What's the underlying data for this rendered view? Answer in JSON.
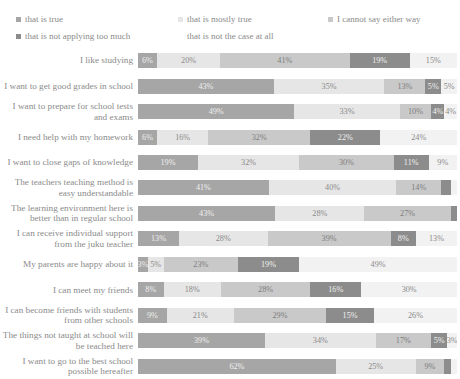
{
  "legend": {
    "rows": [
      [
        {
          "label": "that is true",
          "color": "#a6a6a6",
          "swatch": true
        },
        {
          "label": "that is mostly true",
          "color": "#e6e6e6",
          "swatch": true
        },
        {
          "label": "I cannot say either way",
          "color": "#c9c9c9",
          "swatch": true
        }
      ],
      [
        {
          "label": "that is not applying too much",
          "color": "#8c8c8c",
          "swatch": true
        },
        {
          "label": "that is not the case at all",
          "color": "#f2f2f2",
          "swatch": false
        }
      ]
    ]
  },
  "chart_data": {
    "type": "bar",
    "orientation": "horizontal",
    "stacked": true,
    "stack_total": 100,
    "title": "",
    "xlabel": "",
    "ylabel": "",
    "xlim": [
      0,
      100
    ],
    "grid": false,
    "legend_position": "top",
    "series": [
      {
        "name": "that is true",
        "color": "#a6a6a6",
        "values": [
          6,
          43,
          49,
          6,
          19,
          41,
          43,
          13,
          3,
          8,
          9,
          39,
          62
        ]
      },
      {
        "name": "that is mostly true",
        "color": "#e6e6e6",
        "values": [
          20,
          35,
          33,
          16,
          32,
          40,
          28,
          28,
          5,
          18,
          21,
          34,
          25
        ]
      },
      {
        "name": "I cannot say either way",
        "color": "#c9c9c9",
        "values": [
          41,
          13,
          10,
          32,
          30,
          14,
          27,
          39,
          23,
          28,
          29,
          17,
          9
        ]
      },
      {
        "name": "that is not applying too much",
        "color": "#8c8c8c",
        "values": [
          19,
          5,
          4,
          22,
          11,
          3,
          2,
          8,
          19,
          16,
          15,
          5,
          2
        ]
      },
      {
        "name": "that is not the case at all",
        "color": "#f2f2f2",
        "values": [
          15,
          5,
          4,
          24,
          9,
          2,
          0,
          13,
          49,
          30,
          26,
          3,
          2
        ]
      }
    ],
    "categories": [
      "I like studying",
      "I want to get good grades in school",
      "I want to prepare for school tests and exams",
      "I need help with my homework",
      "I want to close gaps of knowledge",
      "The teachers teaching method is easy understandable",
      "The learning environment here is better than in regular school",
      "I can receive individual support from the juku teacher",
      "My parents are happy about it",
      "I can meet my friends",
      "I can become friends with students from other schools",
      "The things not taught at school will be teached here",
      "I want to go to the best school possible hereafter"
    ],
    "data_labels": [
      [
        "6%",
        "20%",
        "41%",
        "19%",
        "15%"
      ],
      [
        "43%",
        "35%",
        "13%",
        "5%",
        "5%"
      ],
      [
        "49%",
        "33%",
        "10%",
        "4%",
        "4%"
      ],
      [
        "6%",
        "16%",
        "32%",
        "22%",
        "24%"
      ],
      [
        "19%",
        "32%",
        "30%",
        "11%",
        "9%"
      ],
      [
        "41%",
        "40%",
        "14%",
        "",
        ""
      ],
      [
        "43%",
        "28%",
        "27%",
        "",
        ""
      ],
      [
        "13%",
        "28%",
        "39%",
        "8%",
        "13%"
      ],
      [
        "3%",
        "5%",
        "23%",
        "19%",
        "49%"
      ],
      [
        "8%",
        "18%",
        "28%",
        "16%",
        "30%"
      ],
      [
        "9%",
        "21%",
        "29%",
        "15%",
        "26%"
      ],
      [
        "39%",
        "34%",
        "17%",
        "5%",
        "3%"
      ],
      [
        "62%",
        "25%",
        "9%",
        "",
        ""
      ]
    ]
  }
}
